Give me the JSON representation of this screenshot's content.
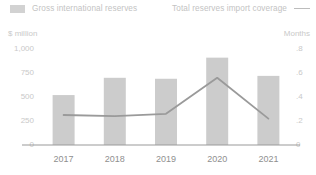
{
  "legend": {
    "bar_series_label": "Gross international reserves",
    "line_series_label": "Total reserves import coverage",
    "bar_swatch_icon": "bar-swatch-icon",
    "line_swatch_icon": "line-swatch-icon"
  },
  "axes": {
    "left_title": "$ million",
    "right_title": "Months"
  },
  "colors": {
    "bar": "#cccccc",
    "line": "#9a9a9a",
    "axis": "#9a9a9a",
    "tick_text": "#c9c9c9",
    "xlabel_text": "#8f8f8f",
    "background": "#ffffff"
  },
  "chart_data": {
    "type": "bar",
    "title": "",
    "subtitle": "",
    "xlabel": "",
    "ylabel": "$ million",
    "y2label": "Months",
    "categories": [
      "2017",
      "2018",
      "2019",
      "2020",
      "2021"
    ],
    "ylim": [
      0,
      1000
    ],
    "yticks": [
      0,
      250,
      500,
      750,
      1000
    ],
    "ytick_labels": [
      "0",
      "250",
      "500",
      "750",
      "1,000"
    ],
    "y2lim": [
      0,
      0.8
    ],
    "y2ticks": [
      0,
      0.2,
      0.4,
      0.6,
      0.8
    ],
    "y2tick_labels": [
      "0",
      ".2",
      ".4",
      ".6",
      ".8"
    ],
    "grid": false,
    "legend_position": "top",
    "series": [
      {
        "name": "Gross international reserves",
        "type": "bar",
        "axis": "left",
        "unit": "$ million",
        "values": [
          520,
          700,
          690,
          910,
          720
        ]
      },
      {
        "name": "Total reserves import coverage",
        "type": "line",
        "axis": "right",
        "unit": "Months",
        "values": [
          0.25,
          0.24,
          0.26,
          0.56,
          0.22
        ]
      }
    ]
  }
}
